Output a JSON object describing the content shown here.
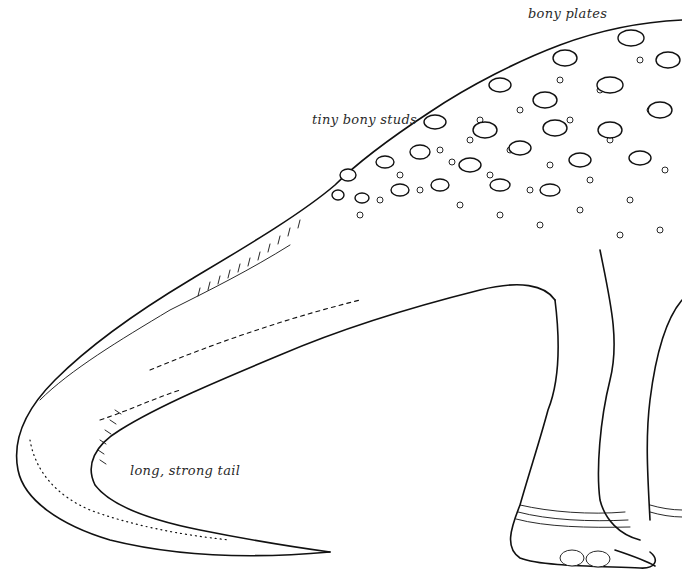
{
  "illustration": {
    "subject": "armored dinosaur hindquarters and tail",
    "labels": {
      "bony_plates": "bony plates",
      "tiny_bony_studs": "tiny bony studs",
      "tail": "long, strong tail"
    }
  },
  "colors": {
    "background": "#ffffff",
    "ink": "#111111",
    "label_text": "#2a2a2a"
  }
}
